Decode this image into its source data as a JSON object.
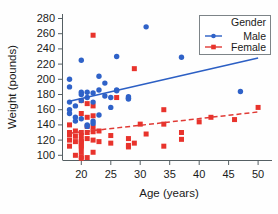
{
  "chart_data": {
    "type": "scatter",
    "title": "",
    "xlabel": "Age (years)",
    "ylabel": "Weight (pounds)",
    "xlim": [
      17,
      51
    ],
    "ylim": [
      92,
      288
    ],
    "xticks": [
      20,
      25,
      30,
      35,
      40,
      45,
      50
    ],
    "yticks": [
      100,
      120,
      140,
      160,
      180,
      200,
      220,
      240,
      260,
      280
    ],
    "grid": false,
    "legend": {
      "title": "Gender",
      "position": "top-right",
      "entries": [
        {
          "name": "Male",
          "color": "#2f62c8",
          "marker": "circle",
          "line": "solid"
        },
        {
          "name": "Female",
          "color": "#e8332c",
          "marker": "square",
          "line": "dashed"
        }
      ]
    },
    "series": [
      {
        "name": "Male",
        "color": "#2f62c8",
        "marker": "circle",
        "points": [
          [
            18,
            170
          ],
          [
            18,
            200
          ],
          [
            18,
            190
          ],
          [
            18,
            160
          ],
          [
            18,
            155
          ],
          [
            19,
            165
          ],
          [
            19,
            145
          ],
          [
            19,
            150
          ],
          [
            20,
            225
          ],
          [
            20,
            183
          ],
          [
            20,
            180
          ],
          [
            20,
            172
          ],
          [
            20,
            148
          ],
          [
            21,
            183
          ],
          [
            21,
            176
          ],
          [
            21,
            140
          ],
          [
            21,
            138
          ],
          [
            22,
            182
          ],
          [
            22,
            170
          ],
          [
            22,
            145
          ],
          [
            22,
            142
          ],
          [
            23,
            204
          ],
          [
            23,
            186
          ],
          [
            23,
            153
          ],
          [
            24,
            195
          ],
          [
            24,
            178
          ],
          [
            25,
            163
          ],
          [
            25,
            176
          ],
          [
            26,
            230
          ],
          [
            26,
            186
          ],
          [
            26,
            185
          ],
          [
            28,
            177
          ],
          [
            28,
            175
          ],
          [
            28,
            174
          ],
          [
            31,
            269
          ],
          [
            37,
            229
          ],
          [
            47,
            184
          ]
        ]
      },
      {
        "name": "Female",
        "color": "#e8332c",
        "marker": "square",
        "points": [
          [
            18,
            140
          ],
          [
            18,
            130
          ],
          [
            18,
            128
          ],
          [
            18,
            127
          ],
          [
            18,
            120
          ],
          [
            18,
            112
          ],
          [
            19,
            132
          ],
          [
            19,
            125
          ],
          [
            19,
            118
          ],
          [
            19,
            100
          ],
          [
            20,
            172
          ],
          [
            20,
            155
          ],
          [
            20,
            130
          ],
          [
            20,
            126
          ],
          [
            20,
            120
          ],
          [
            20,
            118
          ],
          [
            20,
            116
          ],
          [
            20,
            112
          ],
          [
            20,
            110
          ],
          [
            20,
            104
          ],
          [
            20,
            98
          ],
          [
            20,
            96
          ],
          [
            21,
            168
          ],
          [
            21,
            150
          ],
          [
            21,
            138
          ],
          [
            21,
            130
          ],
          [
            21,
            122
          ],
          [
            21,
            97
          ],
          [
            22,
            258
          ],
          [
            22,
            165
          ],
          [
            22,
            152
          ],
          [
            22,
            137
          ],
          [
            22,
            131
          ],
          [
            22,
            120
          ],
          [
            22,
            104
          ],
          [
            23,
            132
          ],
          [
            23,
            118
          ],
          [
            25,
            126
          ],
          [
            25,
            116
          ],
          [
            26,
            176
          ],
          [
            28,
            122
          ],
          [
            28,
            113
          ],
          [
            28,
            111
          ],
          [
            29,
            214
          ],
          [
            29,
            116
          ],
          [
            30,
            141
          ],
          [
            31,
            128
          ],
          [
            34,
            160
          ],
          [
            34,
            141
          ],
          [
            34,
            112
          ],
          [
            37,
            130
          ],
          [
            37,
            121
          ],
          [
            40,
            144
          ],
          [
            42,
            150
          ],
          [
            46,
            147
          ],
          [
            50,
            163
          ]
        ]
      }
    ],
    "trendlines": [
      {
        "name": "Male",
        "style": "solid",
        "color": "#2c5fc4",
        "x0": 18,
        "y0": 171,
        "x1": 50,
        "y1": 228
      },
      {
        "name": "Female",
        "style": "dashed",
        "color": "#e03a35",
        "x0": 18,
        "y0": 129,
        "x1": 50,
        "y1": 157
      }
    ]
  },
  "axes": {
    "x_title": "Age (years)",
    "y_title": "Weight (pounds)",
    "x_ticks": [
      "20",
      "25",
      "30",
      "35",
      "40",
      "45",
      "50"
    ],
    "y_ticks": [
      "280",
      "260",
      "240",
      "220",
      "200",
      "180",
      "160",
      "140",
      "120",
      "100"
    ]
  },
  "legend": {
    "title": "Gender",
    "male_label": "Male",
    "female_label": "Female"
  },
  "colors": {
    "male": "#2f62c8",
    "female": "#e8332c",
    "axis": "#555f63",
    "text": "#1a1a1a",
    "background": "#fefefe"
  }
}
